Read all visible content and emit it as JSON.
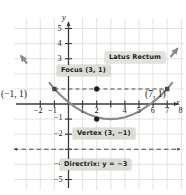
{
  "figure": {
    "background": "#ffffff",
    "grid_color": "#d8d8d2",
    "axis_color": "#3a3a3a",
    "curve_color": "#8a8a8a",
    "label_bg": "#dcdcd7",
    "label_fg": "#1b1b1b"
  },
  "axes": {
    "x_name": "x",
    "y_name": "y",
    "x_ticks": [
      {
        "value": -2,
        "label": "−2"
      },
      {
        "value": -1,
        "label": "−1"
      },
      {
        "value": 1,
        "label": "1"
      },
      {
        "value": 2,
        "label": "2"
      },
      {
        "value": 4,
        "label": "4"
      },
      {
        "value": 5,
        "label": "5"
      },
      {
        "value": 6,
        "label": "6"
      },
      {
        "value": 7,
        "label": "7"
      },
      {
        "value": 8,
        "label": "8"
      }
    ],
    "y_ticks": [
      {
        "value": 5,
        "label": "5"
      },
      {
        "value": 4,
        "label": "4"
      },
      {
        "value": 3,
        "label": "3"
      },
      {
        "value": 2,
        "label": "2"
      },
      {
        "value": -1,
        "label": "−1"
      },
      {
        "value": -2,
        "label": "−2"
      },
      {
        "value": -4,
        "label": "−4"
      },
      {
        "value": -5,
        "label": "−5"
      }
    ]
  },
  "callouts": {
    "latus_rectum": "Latus Rectum",
    "focus": "Focus (3, 1)",
    "vertex": "Vertex (3, −1)",
    "directrix": "Directrix: y = −3"
  },
  "point_labels": {
    "left": "(−1, 1)",
    "right": "(7, 1)"
  },
  "chart_data": {
    "type": "line",
    "title": "",
    "xlabel": "x",
    "ylabel": "y",
    "xlim": [
      -3,
      8.7
    ],
    "ylim": [
      -5.6,
      5.6
    ],
    "grid": true,
    "legend": "none",
    "series": [
      {
        "name": "parabola",
        "equation": "(x − 3)² = 8(y + 1)",
        "x": [
          -1.35,
          -1.0,
          -0.5,
          0,
          0.5,
          1,
          1.5,
          2,
          2.5,
          3,
          3.5,
          4,
          4.5,
          5,
          6,
          6.5,
          7,
          7.35
        ],
        "y": [
          1.4,
          1.0,
          0.531,
          0.125,
          -0.219,
          -0.5,
          -0.719,
          -0.875,
          -0.969,
          -1.0,
          -0.969,
          -0.875,
          -0.719,
          -0.5,
          0.125,
          0.531,
          1.0,
          1.4
        ]
      }
    ],
    "annotations": {
      "vertex": {
        "x": 3,
        "y": -1,
        "label": "Vertex (3, −1)"
      },
      "focus": {
        "x": 3,
        "y": 1,
        "label": "Focus (3, 1)"
      },
      "latus_rectum": {
        "y": 1,
        "x_from": -1,
        "x_to": 7,
        "label": "Latus Rectum",
        "style": "dashed"
      },
      "directrix": {
        "y": -3,
        "label": "Directrix: y = −3",
        "style": "dashed-double-arrow"
      },
      "endpoints": [
        {
          "x": -1,
          "y": 1,
          "label": "(−1, 1)"
        },
        {
          "x": 7,
          "y": 1,
          "label": "(7, 1)"
        }
      ]
    }
  }
}
